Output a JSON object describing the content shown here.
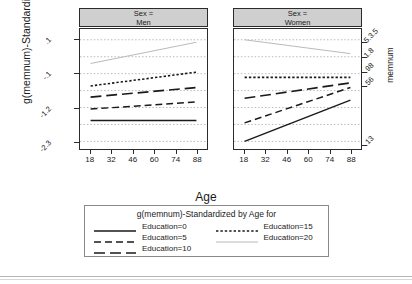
{
  "chart_data": {
    "type": "line",
    "title": "",
    "xlabel": "Age",
    "ylabel": "g(memnum)-Standardized",
    "ylabel_right": "memnum",
    "panel_variable": "Sex",
    "panels": [
      {
        "header_line1": "Sex =",
        "header_line2": "Men",
        "series": [
          {
            "name": "Education=0",
            "style": "solid",
            "x": [
              18,
              88
            ],
            "values": [
              -1.62,
              -1.62
            ]
          },
          {
            "name": "Education=5",
            "style": "dashed",
            "x": [
              18,
              88
            ],
            "values": [
              -1.25,
              -1.02
            ]
          },
          {
            "name": "Education=10",
            "style": "longdash",
            "x": [
              18,
              88
            ],
            "values": [
              -0.86,
              -0.55
            ]
          },
          {
            "name": "Education=15",
            "style": "dotted",
            "x": [
              18,
              88
            ],
            "values": [
              -0.5,
              -0.05
            ]
          },
          {
            "name": "Education=20",
            "style": "finedotted",
            "x": [
              18,
              88
            ],
            "values": [
              0.23,
              0.92
            ]
          }
        ]
      },
      {
        "header_line1": "Sex =",
        "header_line2": "Women",
        "series": [
          {
            "name": "Education=0",
            "style": "solid",
            "x": [
              18,
              88
            ],
            "values": [
              -2.3,
              -0.96
            ]
          },
          {
            "name": "Education=5",
            "style": "dashed",
            "x": [
              18,
              88
            ],
            "values": [
              -1.7,
              -0.55
            ]
          },
          {
            "name": "Education=10",
            "style": "longdash",
            "x": [
              18,
              88
            ],
            "values": [
              -0.9,
              -0.4
            ]
          },
          {
            "name": "Education=15",
            "style": "dotted",
            "x": [
              18,
              88
            ],
            "values": [
              -0.22,
              -0.22
            ]
          },
          {
            "name": "Education=20",
            "style": "finedotted",
            "x": [
              18,
              88
            ],
            "values": [
              1.0,
              0.55
            ]
          }
        ]
      }
    ],
    "x": {
      "ticks": [
        18,
        32,
        46,
        60,
        74,
        88
      ],
      "ticklabels": [
        "18",
        "32",
        "46",
        "60",
        "74",
        "88"
      ],
      "lim": [
        11,
        95
      ]
    },
    "y_left": {
      "ticks": [
        1.0,
        -0.1,
        -1.2,
        -2.3
      ],
      "ticklabels": [
        ".1",
        "-.1",
        "-1.2",
        "-2.3"
      ],
      "lim": [
        -2.55,
        1.35
      ]
    },
    "y_right": {
      "ticklabels": [
        "5.3.5",
        "1.8",
        ".98",
        ".56",
        ".13"
      ]
    },
    "grid": "horizontal-dotted",
    "legend_position": "bottom"
  },
  "legend": {
    "title": "g(memnum)-Standardized by Age for",
    "items": [
      {
        "label": "Education=0",
        "style": "solid"
      },
      {
        "label": "Education=15",
        "style": "dotted"
      },
      {
        "label": "Education=5",
        "style": "dashed"
      },
      {
        "label": "Education=20",
        "style": "finedotted"
      },
      {
        "label": "Education=10",
        "style": "longdash"
      }
    ]
  },
  "colors": {
    "header_fill": "#cfcfcf",
    "frame": "#2b2b2b",
    "grid": "#9a9a9a",
    "line_dark": "#1a1a1a",
    "line_light": "#b9b9b9"
  }
}
